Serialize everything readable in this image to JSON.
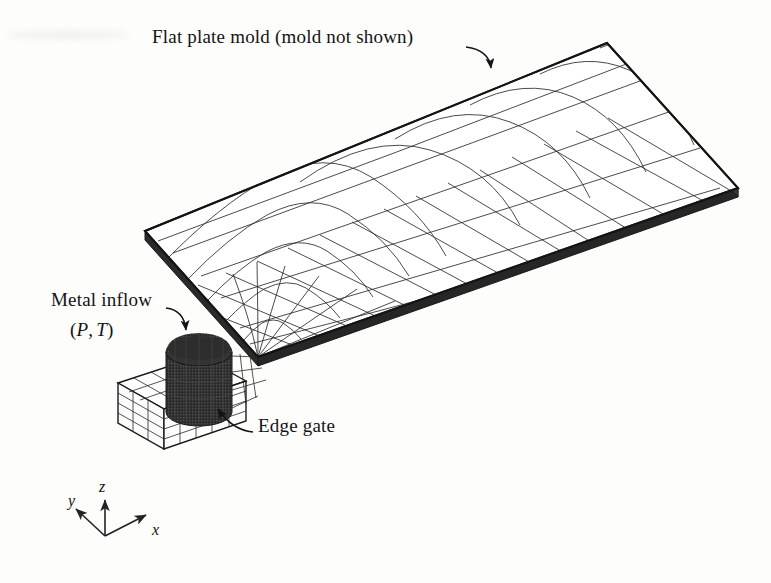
{
  "figure": {
    "kind": "engineering-diagram",
    "background_color": "#fdfdfc",
    "line_color": "#1a1a1a"
  },
  "labels": {
    "title": "Flat plate mold (mold not shown)",
    "metal_inflow": "Metal inflow",
    "metal_inflow_params_open": "(",
    "metal_inflow_params_p": "P",
    "metal_inflow_params_comma": ",",
    "metal_inflow_params_t": "T",
    "metal_inflow_params_close": ")",
    "edge_gate": "Edge gate"
  },
  "axes": {
    "x": "x",
    "y": "y",
    "z": "z",
    "origin": [
      105,
      536
    ]
  },
  "geometry": {
    "plate": {
      "corner_left": [
        145,
        231
      ],
      "corner_top": [
        607,
        43
      ],
      "corner_right": [
        738,
        188
      ],
      "corner_gate": [
        258,
        357
      ],
      "thickness_px": 9,
      "fill": "#ffffff",
      "edge_color": "#1a1a1a"
    },
    "runner": {
      "origin": [
        118,
        383
      ],
      "width_px": 128,
      "height_px": 44,
      "layers": 4
    },
    "sprue": {
      "center": [
        199,
        382
      ],
      "radius_x": 33,
      "radius_y": 14,
      "height_px": 86,
      "fill": "#2b2b2b"
    },
    "mesh": {
      "fan_rays": 19,
      "fan_arcs": 9,
      "long_divisions": 13,
      "trans_divisions": 9
    }
  },
  "annotations": [
    {
      "name": "title-arrow",
      "from": [
        466,
        47
      ],
      "to": [
        492,
        76
      ]
    },
    {
      "name": "inflow-arrow",
      "from": [
        166,
        308
      ],
      "to": [
        187,
        337
      ]
    },
    {
      "name": "gate-arrow",
      "from": [
        253,
        432
      ],
      "to": [
        214,
        405
      ]
    }
  ]
}
